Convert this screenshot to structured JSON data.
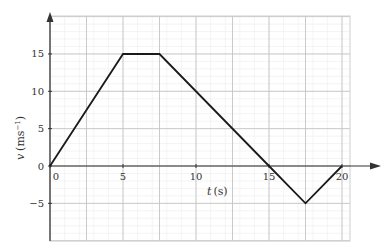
{
  "chart_data": {
    "type": "line",
    "title": "",
    "xlabel": "t (s)",
    "ylabel": "v (ms⁻¹)",
    "xlabel_parts": {
      "var": "t",
      "unit": "(s)"
    },
    "ylabel_parts": {
      "var": "v",
      "unit": "(ms",
      "exp": "−1",
      "close": ")"
    },
    "x": [
      0,
      5,
      7.5,
      15,
      17.5,
      20
    ],
    "series": [
      {
        "name": "velocity",
        "values": [
          0,
          15,
          15,
          0,
          -5,
          0
        ]
      }
    ],
    "xlim": [
      0,
      20.5
    ],
    "ylim": [
      -10,
      20
    ],
    "x_ticks": [
      0,
      5,
      10,
      15,
      20
    ],
    "y_ticks": [
      -5,
      0,
      5,
      10,
      15
    ],
    "x_tick_labels": [
      "0",
      "5",
      "10",
      "15",
      "20"
    ],
    "y_tick_labels": [
      "−5",
      "0",
      "5",
      "10",
      "15"
    ],
    "grid": true,
    "minor_grid": true,
    "legend": null
  },
  "colors": {
    "line": "#1a1a1a",
    "axis": "#333333",
    "major_grid": "#c4c4c4",
    "minor_grid": "#ececec"
  }
}
